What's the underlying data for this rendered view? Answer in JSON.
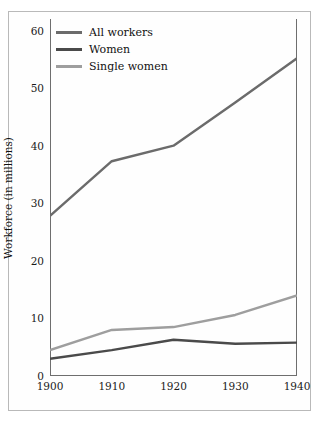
{
  "chart_data": {
    "type": "line",
    "title": "",
    "xlabel": "",
    "ylabel": "Workforce (in millions)",
    "x": [
      1900,
      1910,
      1920,
      1930,
      1940
    ],
    "xticklabels": [
      "1900",
      "1910",
      "1920",
      "1930",
      "1940"
    ],
    "yticklabels": [
      "0",
      "10",
      "20",
      "30",
      "40",
      "50",
      "60"
    ],
    "yticks": [
      0,
      10,
      20,
      30,
      40,
      50,
      60
    ],
    "xlim": [
      1900,
      1940
    ],
    "ylim": [
      0,
      62
    ],
    "grid": false,
    "legend_position": "upper left",
    "series": [
      {
        "name": "All workers",
        "color": "#6b6b6b",
        "values": [
          27.8,
          37.3,
          40.0,
          47.5,
          55.2
        ]
      },
      {
        "name": "Women",
        "color": "#4a4a4a",
        "values": [
          3.0,
          4.5,
          6.3,
          5.6,
          5.8
        ]
      },
      {
        "name": "Single women",
        "color": "#9e9e9e",
        "values": [
          4.5,
          8.0,
          8.5,
          10.6,
          14.0
        ]
      }
    ]
  },
  "legend": {
    "items": [
      {
        "label": "All workers"
      },
      {
        "label": "Women"
      },
      {
        "label": "Single women"
      }
    ]
  },
  "axes": {
    "y_title": "Workforce (in millions)"
  },
  "colors": {
    "all_workers": "#6b6b6b",
    "women": "#4a4a4a",
    "single_women": "#9e9e9e",
    "axis": "#6e6e6e",
    "frame": "#b9b9b9",
    "text": "#111111"
  }
}
